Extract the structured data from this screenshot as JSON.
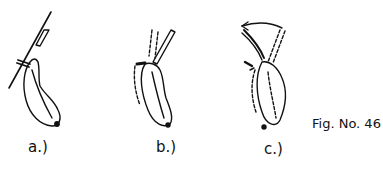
{
  "figure": {
    "caption": "Fig. No. 46",
    "panels": [
      {
        "id": "a",
        "label": "a.)"
      },
      {
        "id": "b",
        "label": "b.)"
      },
      {
        "id": "c",
        "label": "c.)"
      }
    ],
    "colors": {
      "ink": "#111111",
      "background": "#ffffff"
    }
  }
}
